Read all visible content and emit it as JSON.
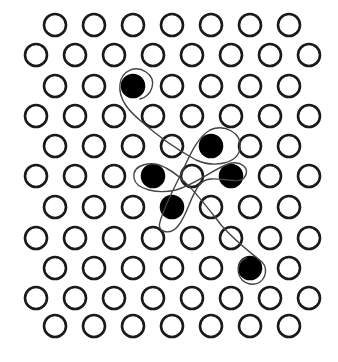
{
  "diagram": {
    "type": "hexagonal-lattice-with-path",
    "lattice": {
      "rows": 11,
      "row_y": [
        25,
        55,
        86,
        116,
        146,
        176,
        207,
        238,
        268,
        298,
        326
      ],
      "even_row_x": [
        55,
        94,
        133,
        172,
        211,
        250,
        289
      ],
      "odd_row_x": [
        36,
        75,
        114,
        153,
        192,
        231,
        270,
        309
      ],
      "radius": 11,
      "open_color": "#1a1a1a",
      "filled_color": "#000000"
    },
    "filled_sites": [
      {
        "row": 2,
        "x": 133,
        "y": 86
      },
      {
        "row": 4,
        "x": 211,
        "y": 146
      },
      {
        "row": 5,
        "x": 153,
        "y": 176
      },
      {
        "row": 5,
        "x": 231,
        "y": 176
      },
      {
        "row": 6,
        "x": 172,
        "y": 207
      },
      {
        "row": 8,
        "x": 250,
        "y": 268
      }
    ],
    "path": {
      "description": "Continuous curve starting with a loop around the top filled site, winding diagonally and looping around each filled site, ending with a loop around the bottom-right filled site",
      "color": "#444444"
    }
  }
}
